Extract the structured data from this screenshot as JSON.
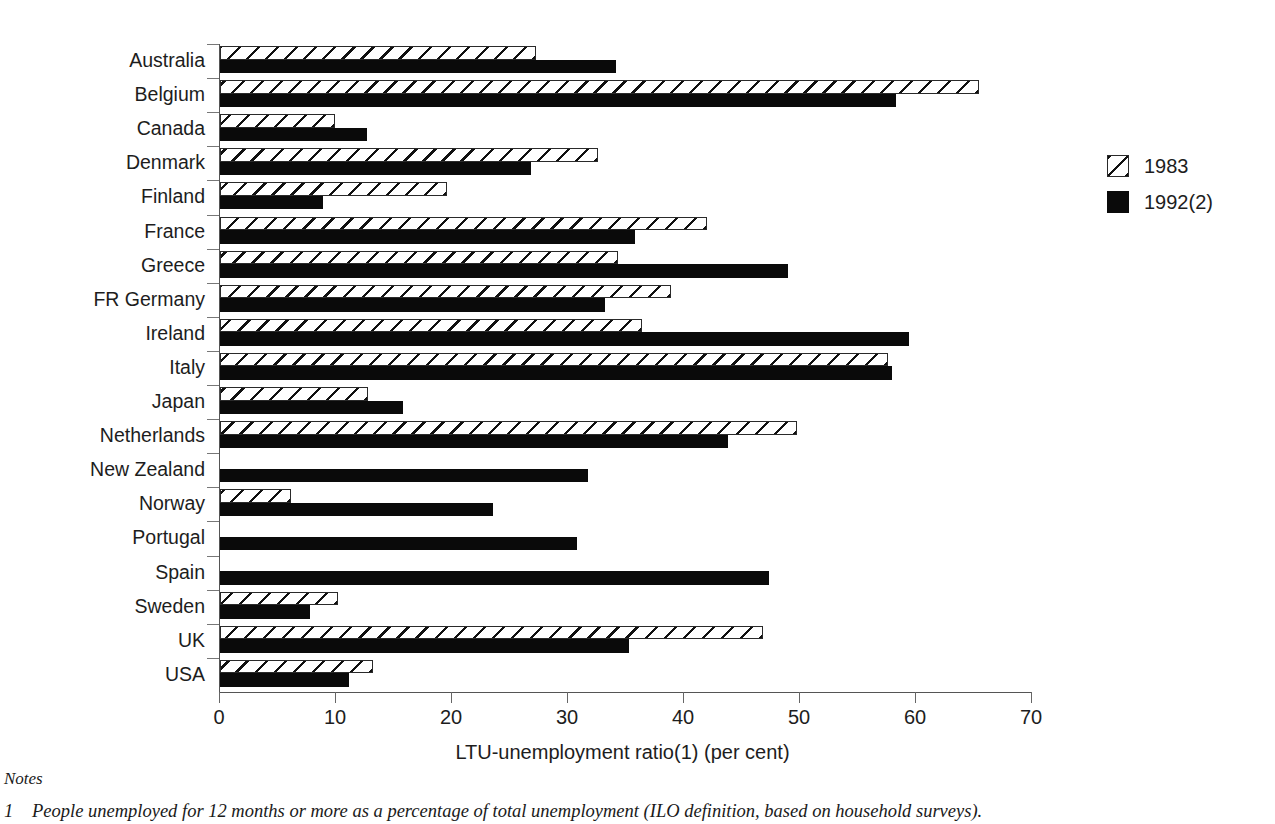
{
  "chart_data": {
    "type": "bar",
    "orientation": "horizontal",
    "title": "",
    "xlabel": "LTU-unemployment ratio(1) (per cent)",
    "ylabel": "",
    "xlim": [
      0,
      70
    ],
    "xticks": [
      0,
      10,
      20,
      30,
      40,
      50,
      60,
      70
    ],
    "grid": false,
    "legend_position": "right",
    "categories": [
      "Australia",
      "Belgium",
      "Canada",
      "Denmark",
      "Finland",
      "France",
      "Greece",
      "FR Germany",
      "Ireland",
      "Italy",
      "Japan",
      "Netherlands",
      "New Zealand",
      "Norway",
      "Portugal",
      "Spain",
      "Sweden",
      "UK",
      "USA"
    ],
    "series": [
      {
        "name": "1983",
        "style": "hatched",
        "values": [
          27.2,
          65.4,
          9.9,
          32.6,
          19.6,
          42.0,
          34.3,
          38.9,
          36.4,
          57.6,
          12.8,
          49.7,
          null,
          6.1,
          null,
          null,
          10.2,
          46.8,
          13.2
        ]
      },
      {
        "name": "1992(2)",
        "style": "solid-black",
        "values": [
          34.1,
          58.3,
          12.7,
          26.8,
          8.9,
          35.8,
          49.0,
          33.2,
          59.4,
          57.9,
          15.8,
          43.8,
          31.7,
          23.5,
          30.8,
          47.3,
          7.8,
          35.3,
          11.1
        ]
      }
    ]
  },
  "legend": {
    "items": [
      {
        "label": "1983",
        "swatch": "hatched"
      },
      {
        "label": "1992(2)",
        "swatch": "solid-black"
      }
    ]
  },
  "axis": {
    "x_title": "LTU-unemployment ratio(1) (per cent)",
    "tick_labels": [
      "0",
      "10",
      "20",
      "30",
      "40",
      "50",
      "60",
      "70"
    ]
  },
  "notes": {
    "heading": "Notes",
    "items": [
      {
        "number": "1",
        "text": "People unemployed for 12 months or more as a percentage of total unemployment (ILO definition, based on household surveys)."
      }
    ]
  },
  "colors": {
    "series_1983": "#ffffff",
    "series_1992": "#0a0a0a",
    "axis": "#555555",
    "text": "#1d1d1d",
    "background": "#ffffff"
  }
}
